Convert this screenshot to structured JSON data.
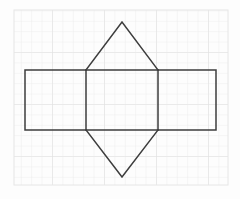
{
  "canvas": {
    "width": 240,
    "height": 199,
    "background_color": "#fdfdfd"
  },
  "graph_paper": {
    "name": "grid-paper",
    "x": 14,
    "y": 10,
    "width": 214,
    "height": 175,
    "cell_size": 10.4,
    "minor_line_color": "#ededed",
    "major_line_color": "#e0e0e0",
    "major_every": 5,
    "border_color": "#e6e6e6",
    "paper_color": "#fdfdfd"
  },
  "figure": {
    "name": "polygon-net-diagram",
    "stroke_color": "#3d3d3d",
    "stroke_width": 1.5,
    "fill": "none",
    "outer_rectangle": {
      "name": "outer-rectangle",
      "left": 25,
      "top": 70,
      "right": 216,
      "bottom": 130,
      "width": 191,
      "height": 60
    },
    "center_panel": {
      "name": "center-square-panel",
      "left": 86,
      "top": 70,
      "right": 158,
      "bottom": 130,
      "width": 72,
      "height": 60
    },
    "left_panel": {
      "name": "left-rectangle-panel",
      "left": 25,
      "top": 70,
      "right": 86,
      "bottom": 130
    },
    "right_panel": {
      "name": "right-rectangle-panel",
      "left": 158,
      "top": 70,
      "right": 216,
      "bottom": 130
    },
    "top_triangle": {
      "name": "top-triangle",
      "apex_x": 122,
      "apex_y": 22,
      "base_left_x": 86,
      "base_right_x": 158,
      "base_y": 70
    },
    "bottom_triangle": {
      "name": "bottom-triangle",
      "apex_x": 122,
      "apex_y": 177,
      "base_left_x": 86,
      "base_right_x": 158,
      "base_y": 130
    }
  },
  "chart_data": {
    "type": "scatter",
    "title": "",
    "xlabel": "",
    "ylabel": "",
    "grid": true,
    "annotations": []
  }
}
